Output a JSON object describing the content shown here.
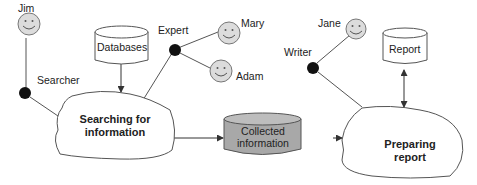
{
  "actors": [
    {
      "id": "jim",
      "name": "Jim"
    },
    {
      "id": "mary",
      "name": "Mary"
    },
    {
      "id": "adam",
      "name": "Adam"
    },
    {
      "id": "jane",
      "name": "Jane"
    }
  ],
  "roles": [
    {
      "id": "searcher",
      "label": "Searcher"
    },
    {
      "id": "expert",
      "label": "Expert"
    },
    {
      "id": "writer",
      "label": "Writer"
    }
  ],
  "stores": {
    "databases": "Databases",
    "collected_line1": "Collected",
    "collected_line2": "information",
    "report": "Report"
  },
  "processes": {
    "searching_line1": "Searching for",
    "searching_line2": "information",
    "preparing_line1": "Preparing",
    "preparing_line2": "report"
  },
  "colors": {
    "face_fill": "#dcdcdc",
    "role_node": "#111111",
    "collected_fill": "#a8a8a8",
    "line": "#444444"
  }
}
